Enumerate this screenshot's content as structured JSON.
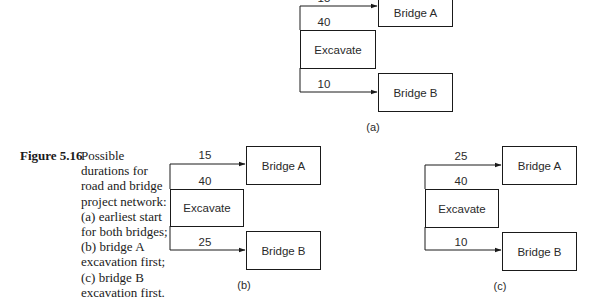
{
  "figure": {
    "label": "Figure 5.16",
    "caption_lines": [
      "Possible",
      "durations for",
      "road and bridge",
      "project network:",
      "(a) earliest start",
      "for both bridges;",
      "(b) bridge A",
      "excavation first;",
      "(c) bridge B",
      "excavation first."
    ]
  },
  "diagrams": {
    "a": {
      "sublabel": "(a)",
      "excavate": {
        "label": "Excavate",
        "duration": "40"
      },
      "bridge_a": {
        "label": "Bridge A",
        "lag": "15"
      },
      "bridge_b": {
        "label": "Bridge B",
        "lag": "10"
      }
    },
    "b": {
      "sublabel": "(b)",
      "excavate": {
        "label": "Excavate",
        "duration": "40"
      },
      "bridge_a": {
        "label": "Bridge A",
        "lag": "15"
      },
      "bridge_b": {
        "label": "Bridge B",
        "lag": "25"
      }
    },
    "c": {
      "sublabel": "(c)",
      "excavate": {
        "label": "Excavate",
        "duration": "40"
      },
      "bridge_a": {
        "label": "Bridge A",
        "lag": "25"
      },
      "bridge_b": {
        "label": "Bridge B",
        "lag": "10"
      }
    }
  },
  "colors": {
    "line": "#1a1a1a",
    "text": "#2a2a2a",
    "background": "#ffffff"
  }
}
